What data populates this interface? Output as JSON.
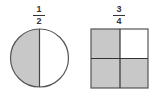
{
  "figures": [
    {
      "shape": "circle",
      "fraction": {
        "numerator": "1",
        "denominator": "2"
      },
      "parts": 2,
      "shaded_parts": 1
    },
    {
      "shape": "square",
      "fraction": {
        "numerator": "3",
        "denominator": "4"
      },
      "parts": 4,
      "shaded_parts": 3
    }
  ],
  "colors": {
    "shade": "#c8c8c8",
    "stroke": "#555555",
    "background": "#ffffff"
  }
}
